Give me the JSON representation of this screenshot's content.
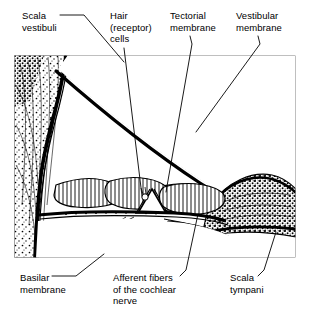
{
  "figure": {
    "background_color": "#ffffff",
    "ink_color": "#000000",
    "frame_color": "#808080"
  },
  "labels": {
    "scala_vestibuli": {
      "line1": "Scala",
      "line2": "vestibuli"
    },
    "hair_cells": {
      "line1": "Hair",
      "line2": "(receptor)",
      "line3": "cells"
    },
    "tectorial_membrane": {
      "line1": "Tectorial",
      "line2": "membrane"
    },
    "vestibular_membrane": {
      "line1": "Vestibular",
      "line2": "membrane"
    },
    "basilar_membrane": {
      "line1": "Basilar",
      "line2": "membrane"
    },
    "afferent_fibers": {
      "line1": "Afferent fibers",
      "line2": "of the cochlear",
      "line3": "nerve"
    },
    "scala_tympani": {
      "line1": "Scala",
      "line2": "tympani"
    }
  },
  "structures": [
    {
      "name": "scala-vestibuli",
      "description": "open fluid chamber above the vestibular membrane"
    },
    {
      "name": "vestibular-membrane",
      "description": "thick diagonal membrane from upper left to right"
    },
    {
      "name": "tectorial-membrane",
      "description": "lens-shaped flap overhanging the hair cells"
    },
    {
      "name": "hair-cells",
      "description": "receptor cells within the organ of Corti"
    },
    {
      "name": "basilar-membrane",
      "description": "horizontal membrane supporting the organ of Corti"
    },
    {
      "name": "afferent-fibers",
      "description": "cochlear nerve fibers leaving to the right"
    },
    {
      "name": "scala-tympani",
      "description": "open fluid chamber below the basilar membrane"
    },
    {
      "name": "bone-tissue",
      "description": "stippled spiral lamina / bony wall on the left"
    },
    {
      "name": "spiral-ligament",
      "description": "stippled tissue wedge on the right"
    }
  ]
}
